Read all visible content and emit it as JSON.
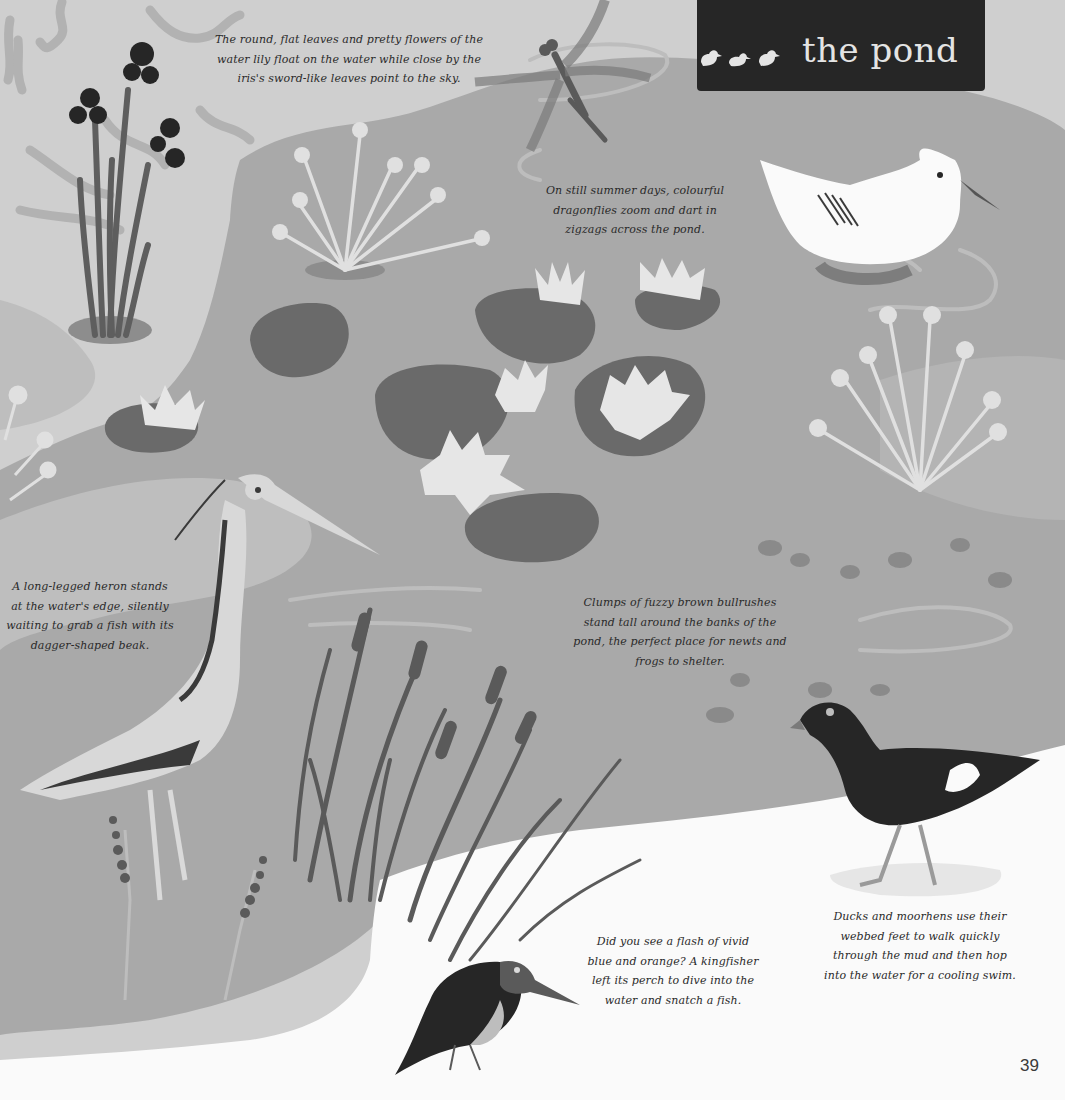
{
  "page": {
    "title": "the pond",
    "title_icon": "ducklings-icon",
    "page_number": "39",
    "colors": {
      "background_light": "#cfcfcf",
      "water": "#a9a9a9",
      "lily_pad": "#6a6a6a",
      "dark_ink": "#262626",
      "bank_white": "#fafafa",
      "title_banner": "#262626",
      "title_text": "#e4e4e4"
    }
  },
  "captions": {
    "water_lily": {
      "lines": [
        "The round, flat leaves and pretty flowers of the",
        "water lily float on the water while close by the",
        "iris's sword-like leaves point to the sky."
      ]
    },
    "dragonfly": {
      "lines": [
        "On still summer days, colourful",
        "dragonflies zoom and dart in",
        "zigzags across the pond."
      ]
    },
    "heron": {
      "lines": [
        "A long-legged heron stands",
        "at the water's edge, silently",
        "waiting to grab a fish with its",
        "dagger-shaped beak."
      ]
    },
    "bullrushes": {
      "lines": [
        "Clumps of fuzzy brown bullrushes",
        "stand tall around the banks of the",
        "pond, the perfect place for newts and",
        "frogs to shelter."
      ]
    },
    "kingfisher": {
      "lines": [
        "Did you see a flash of vivid",
        "blue and orange? A kingfisher",
        "left its perch to dive into the",
        "water and snatch a fish."
      ]
    },
    "moorhen": {
      "lines": [
        "Ducks and moorhens use their",
        "webbed feet to walk quickly",
        "through the mud and then hop",
        "into the water for a cooling swim."
      ]
    }
  },
  "illustrations": [
    {
      "name": "iris-plant"
    },
    {
      "name": "dragonfly"
    },
    {
      "name": "duck"
    },
    {
      "name": "water-lilies"
    },
    {
      "name": "heron"
    },
    {
      "name": "bullrushes"
    },
    {
      "name": "moorhen"
    },
    {
      "name": "kingfisher"
    }
  ]
}
